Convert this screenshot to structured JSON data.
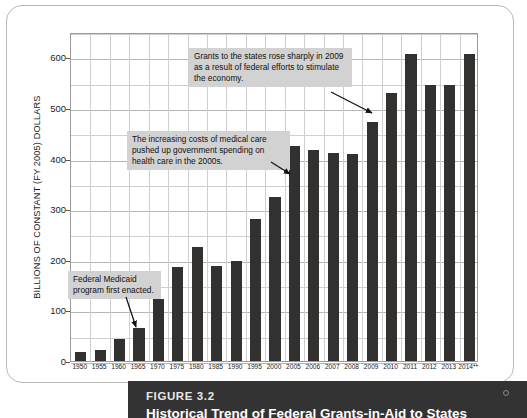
{
  "figure": {
    "caption_label": "FIGURE 3.2",
    "caption_title": "Historical Trend of Federal Grants-in-Aid to States"
  },
  "colors": {
    "bar": "#33312f",
    "annotation_background": "#d2d2d2",
    "grid": "#cfcfcf",
    "caption_background": "#333333",
    "page_border": "#b9b9b9"
  },
  "annotations": [
    {
      "id": "grants",
      "text": "Grants to the states rose sharply in 2009 as a result of federal efforts to stimulate the economy.",
      "points_to": "2009"
    },
    {
      "id": "medical",
      "text": "The increasing costs of medical care pushed up government spending on health care in the 2000s.",
      "points_to": "2005"
    },
    {
      "id": "medicaid",
      "text": "Federal Medicaid program first enacted.",
      "points_to": "1965"
    }
  ],
  "chart_data": {
    "type": "bar",
    "title": "",
    "xlabel": "",
    "ylabel": "BILLIONS OF CONSTANT (FY 2005) DOLLARS",
    "ylim": [
      0,
      650
    ],
    "yticks": [
      0,
      100,
      200,
      300,
      400,
      500,
      600
    ],
    "ytick_labels": [
      "0",
      "100",
      "200",
      "300",
      "400",
      "500",
      "600"
    ],
    "grid": true,
    "grid_minor_step": 50,
    "legend": null,
    "categories": [
      "1950",
      "1955",
      "1960",
      "1965",
      "1970",
      "1975",
      "1980",
      "1985",
      "1990",
      "1995",
      "2000",
      "2005",
      "2006",
      "2007",
      "2008",
      "2009",
      "2010",
      "2011",
      "2012",
      "2013",
      "2014**"
    ],
    "values": [
      18,
      22,
      44,
      65,
      122,
      185,
      226,
      188,
      197,
      281,
      325,
      425,
      416,
      410,
      409,
      473,
      530,
      606,
      545,
      546,
      607
    ]
  }
}
